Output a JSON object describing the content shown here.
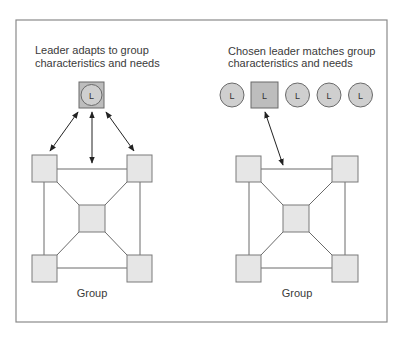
{
  "left_panel": {
    "caption_line1": "Leader adapts to group",
    "caption_line2": "characteristics and needs",
    "leader_label": "L",
    "group_label": "Group"
  },
  "right_panel": {
    "caption_line1": "Chosen leader matches group",
    "caption_line2": "characteristics and needs",
    "candidates": [
      {
        "label": "L",
        "shape": "circle"
      },
      {
        "label": "L",
        "shape": "square",
        "chosen": true
      },
      {
        "label": "L",
        "shape": "circle"
      },
      {
        "label": "L",
        "shape": "circle"
      },
      {
        "label": "L",
        "shape": "circle"
      }
    ],
    "group_label": "Group"
  },
  "colors": {
    "frame": "#8a8a8a",
    "member_fill": "#e6e6e6",
    "leader_fill": "#bdbdbd",
    "candidate_fill": "#cfcfcf",
    "arrow": "#222222"
  }
}
